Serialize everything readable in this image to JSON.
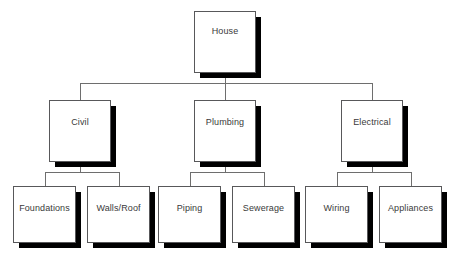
{
  "diagram": {
    "type": "hierarchy-tree",
    "background_color": "#ffffff",
    "box_fill": "#ffffff",
    "box_border_color": "#58585a",
    "shadow_color": "#000000",
    "line_color": "#6e6e6e",
    "text_color": "#3a3a3a",
    "levels": 3,
    "root": {
      "label": "House",
      "x": 194,
      "y": 11,
      "w": 62,
      "h": 62
    },
    "branches": [
      {
        "label": "Civil",
        "x": 49,
        "y": 100,
        "w": 62,
        "h": 62,
        "children": [
          {
            "label": "Foundations",
            "x": 13,
            "y": 186,
            "w": 63,
            "h": 57
          },
          {
            "label": "Walls/Roof",
            "x": 87,
            "y": 186,
            "w": 63,
            "h": 57
          }
        ]
      },
      {
        "label": "Plumbing",
        "x": 194,
        "y": 100,
        "w": 62,
        "h": 62,
        "children": [
          {
            "label": "Piping",
            "x": 158,
            "y": 186,
            "w": 63,
            "h": 57
          },
          {
            "label": "Sewerage",
            "x": 232,
            "y": 186,
            "w": 63,
            "h": 57
          }
        ]
      },
      {
        "label": "Electrical",
        "x": 341,
        "y": 100,
        "w": 62,
        "h": 62,
        "children": [
          {
            "label": "Wiring",
            "x": 305,
            "y": 186,
            "w": 63,
            "h": 57
          },
          {
            "label": "Appliances",
            "x": 379,
            "y": 186,
            "w": 63,
            "h": 57
          }
        ]
      }
    ],
    "connectors": {
      "root_stub": {
        "x": 225,
        "y": 73,
        "h": 10
      },
      "main_bus": {
        "x": 80,
        "y": 83,
        "w": 292
      },
      "branch_drops_y": 83,
      "branch_drop_h": 17,
      "sub_bus_y": 172,
      "sub_bus_stub_h": 10,
      "sub_drop_h": 14
    }
  }
}
